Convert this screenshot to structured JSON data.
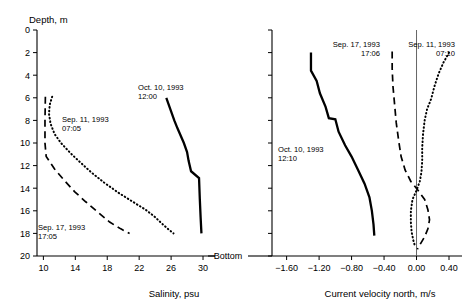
{
  "chart_data": [
    {
      "type": "line",
      "panel": "left",
      "title": "",
      "xlabel": "Salinity, psu",
      "ylabel": "Depth, m",
      "xlim": [
        9.2,
        31.5
      ],
      "ylim": [
        20,
        0
      ],
      "y_inverted": true,
      "grid": false,
      "xticks": [
        10,
        14,
        18,
        22,
        26,
        30
      ],
      "xticklabels": [
        "10",
        "14",
        "18",
        "22",
        "26",
        "30"
      ],
      "yticks": [
        0,
        2,
        4,
        6,
        8,
        10,
        12,
        14,
        16,
        18,
        20
      ],
      "yticklabels": [
        "0",
        "2",
        "4",
        "6",
        "8",
        "10",
        "12",
        "14",
        "16",
        "18",
        "20"
      ],
      "legend_position": "inline-annotations",
      "series": [
        {
          "name": "Oct. 10, 1993 12:00",
          "style": "solid",
          "label_line1": "Oct. 10, 1993",
          "label_line2": "12:00",
          "points": [
            [
              25.4,
              6.0
            ],
            [
              25.9,
              7.0
            ],
            [
              26.4,
              8.0
            ],
            [
              26.8,
              8.7
            ],
            [
              27.6,
              10.0
            ],
            [
              28.0,
              10.8
            ],
            [
              28.2,
              11.6
            ],
            [
              28.5,
              12.5
            ],
            [
              29.5,
              13.1
            ],
            [
              29.6,
              15.0
            ],
            [
              29.7,
              16.6
            ],
            [
              29.8,
              18.0
            ]
          ]
        },
        {
          "name": "Sep. 11, 1993 07:05",
          "style": "dotted",
          "label_line1": "Sep. 11, 1993",
          "label_line2": "07:05",
          "points": [
            [
              11.1,
              5.9
            ],
            [
              10.8,
              6.6
            ],
            [
              10.7,
              7.4
            ],
            [
              10.9,
              8.3
            ],
            [
              11.4,
              9.2
            ],
            [
              12.2,
              10.0
            ],
            [
              13.4,
              10.9
            ],
            [
              14.6,
              11.7
            ],
            [
              16.0,
              12.6
            ],
            [
              17.6,
              13.5
            ],
            [
              19.4,
              14.4
            ],
            [
              21.2,
              15.2
            ],
            [
              22.8,
              15.9
            ],
            [
              23.9,
              16.5
            ],
            [
              24.8,
              17.1
            ],
            [
              25.6,
              17.6
            ],
            [
              26.3,
              18.0
            ]
          ]
        },
        {
          "name": "Sep. 17, 1993 17:05",
          "style": "dashed",
          "label_line1": "Sep. 17, 1993",
          "label_line2": "17:05",
          "points": [
            [
              10.25,
              5.9
            ],
            [
              10.2,
              8.0
            ],
            [
              10.2,
              10.0
            ],
            [
              10.35,
              11.2
            ],
            [
              11.4,
              12.3
            ],
            [
              12.6,
              13.3
            ],
            [
              13.9,
              14.3
            ],
            [
              15.3,
              15.2
            ],
            [
              16.8,
              16.1
            ],
            [
              18.3,
              17.0
            ],
            [
              19.7,
              17.6
            ],
            [
              20.8,
              18.0
            ]
          ]
        }
      ]
    },
    {
      "type": "line",
      "panel": "right",
      "title": "",
      "xlabel": "Current velocity north, m/s",
      "ylabel": "Depth, m",
      "xlim": [
        -1.78,
        0.56
      ],
      "ylim": [
        20,
        0
      ],
      "y_inverted": true,
      "grid": false,
      "zero_reference_line": 0.0,
      "xticks": [
        -1.6,
        -1.2,
        -0.8,
        -0.4,
        0.0,
        0.4
      ],
      "xticklabels": [
        "−1.60",
        "−1.20",
        "−0.80",
        "−0.40",
        "0.00",
        "0.40"
      ],
      "yticks": [
        0,
        2,
        4,
        6,
        8,
        10,
        12,
        14,
        16,
        18,
        20
      ],
      "legend_position": "inline-annotations",
      "series": [
        {
          "name": "Oct. 10, 1993 12:10",
          "style": "solid",
          "label_line1": "Oct. 10, 1993",
          "label_line2": "12:10",
          "points": [
            [
              -1.3,
              2.0
            ],
            [
              -1.3,
              3.6
            ],
            [
              -1.23,
              4.5
            ],
            [
              -1.19,
              5.6
            ],
            [
              -1.12,
              6.8
            ],
            [
              -1.08,
              7.8
            ],
            [
              -1.0,
              7.9
            ],
            [
              -0.96,
              9.0
            ],
            [
              -0.88,
              10.2
            ],
            [
              -0.8,
              11.2
            ],
            [
              -0.72,
              12.4
            ],
            [
              -0.64,
              13.6
            ],
            [
              -0.58,
              14.8
            ],
            [
              -0.55,
              16.0
            ],
            [
              -0.53,
              17.2
            ],
            [
              -0.52,
              18.2
            ]
          ]
        },
        {
          "name": "Sep. 17, 1993 17:06",
          "style": "dashed",
          "label_line1": "Sep. 17, 1993",
          "label_line2": "17:06",
          "points": [
            [
              -0.3,
              1.9
            ],
            [
              -0.3,
              3.4
            ],
            [
              -0.29,
              5.0
            ],
            [
              -0.27,
              6.6
            ],
            [
              -0.25,
              8.2
            ],
            [
              -0.22,
              9.8
            ],
            [
              -0.19,
              11.2
            ],
            [
              -0.14,
              12.4
            ],
            [
              -0.07,
              13.4
            ],
            [
              0.02,
              14.2
            ],
            [
              0.1,
              15.0
            ],
            [
              0.14,
              15.9
            ],
            [
              0.16,
              16.8
            ],
            [
              0.14,
              17.6
            ],
            [
              0.1,
              18.3
            ],
            [
              0.05,
              18.9
            ],
            [
              0.01,
              19.4
            ]
          ]
        },
        {
          "name": "Sep. 11, 1993 07:10",
          "style": "dotted",
          "label_line1": "Sep. 11, 1993",
          "label_line2": "07:10",
          "points": [
            [
              0.4,
              2.0
            ],
            [
              0.33,
              2.9
            ],
            [
              0.27,
              3.9
            ],
            [
              0.22,
              5.0
            ],
            [
              0.18,
              6.1
            ],
            [
              0.13,
              7.0
            ],
            [
              0.1,
              8.0
            ],
            [
              0.08,
              9.2
            ],
            [
              0.07,
              10.4
            ],
            [
              0.07,
              11.6
            ],
            [
              0.06,
              12.6
            ],
            [
              0.04,
              13.4
            ],
            [
              0.0,
              14.2
            ],
            [
              -0.05,
              15.0
            ],
            [
              -0.07,
              16.0
            ],
            [
              -0.07,
              17.0
            ],
            [
              -0.06,
              17.9
            ],
            [
              -0.04,
              18.6
            ],
            [
              -0.02,
              19.1
            ]
          ]
        }
      ]
    }
  ],
  "labels": {
    "depth_axis_title": "Depth, m",
    "bottom_label": "Bottom",
    "left_x_title": "Salinity, psu",
    "right_x_title": "Current velocity north, m/s"
  }
}
